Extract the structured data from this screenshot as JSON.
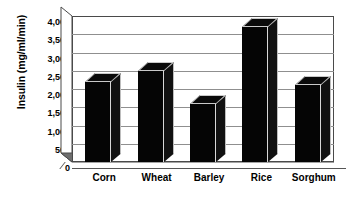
{
  "chart_data": {
    "type": "bar",
    "title": "",
    "subtitle": "",
    "xlabel": "",
    "ylabel": "Insulin (mg/ml/min)",
    "categories": [
      "Corn",
      "Wheat",
      "Barley",
      "Rice",
      "Sorghum"
    ],
    "values": [
      2200,
      2500,
      1600,
      3700,
      2100
    ],
    "series": [
      {
        "name": "Insulin",
        "values": [
          2200,
          2500,
          1600,
          3700,
          2100
        ]
      }
    ],
    "ylim": [
      0,
      4000
    ],
    "ytick_step": 500,
    "ytick_labels": [
      "0",
      "500",
      "1,000",
      "1,500",
      "2,000",
      "2,500",
      "3,000",
      "3,500",
      "4,000"
    ],
    "ytick_values": [
      0,
      500,
      1000,
      1500,
      2000,
      2500,
      3000,
      3500,
      4000
    ],
    "grid": true,
    "grid_axis": "y",
    "legend": false,
    "legend_position": "none",
    "style": "3d-column",
    "bar_color": "#050505",
    "grid_color": "#8f8f8f",
    "axis_color": "#4a4a4a",
    "floor_color": "#6e6e6e",
    "background_color": "#ffffff"
  }
}
